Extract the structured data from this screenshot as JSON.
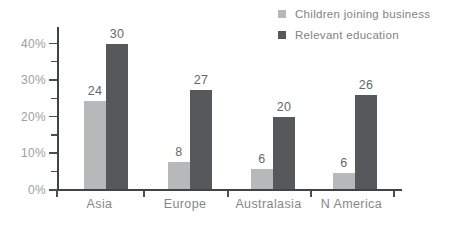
{
  "chart_data": {
    "type": "bar",
    "title": "",
    "xlabel": "",
    "ylabel": "",
    "categories": [
      "Asia",
      "Europe",
      "Australasia",
      "N America"
    ],
    "series": [
      {
        "name": "Children joining business",
        "color": "#b5b9ba",
        "values": [
          24,
          8,
          6,
          6
        ],
        "drawn_pct": [
          24,
          7.5,
          5.5,
          4.5
        ]
      },
      {
        "name": "Relevant education",
        "color": "#56595b",
        "values": [
          30,
          27,
          20,
          26
        ],
        "drawn_pct": [
          39.5,
          27,
          19.8,
          25.7
        ]
      }
    ],
    "y_tick_labels": [
      "0%",
      "10%",
      "20%",
      "30%",
      "40%"
    ],
    "y_major_ticks_pct": [
      0,
      10,
      20,
      30,
      40
    ],
    "y_minor_ticks_pct": [
      5,
      15,
      25,
      35
    ],
    "ylim": [
      0,
      40
    ],
    "grid": false,
    "legend_position": "top-right",
    "value_labels_shown": true,
    "colors": {
      "axis": "#404446",
      "y_tick_label": "#9aa0a2",
      "category_label": "#82888a",
      "value_label": "#63686a",
      "legend_text": "#7e8486",
      "background": "#ffffff"
    }
  }
}
